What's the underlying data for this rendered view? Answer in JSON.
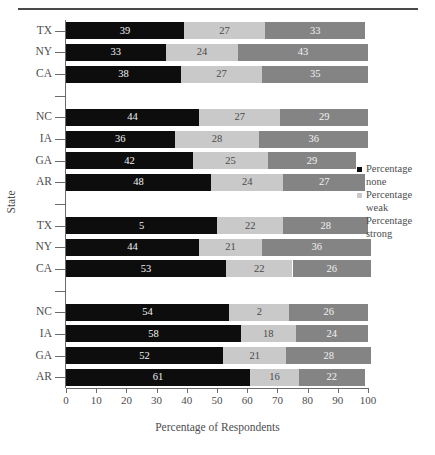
{
  "chart_data": {
    "type": "bar",
    "orientation": "horizontal",
    "stacked": true,
    "title": "",
    "xlabel": "Percentage of Respondents",
    "ylabel": "State",
    "xlim": [
      0,
      100
    ],
    "xticks": [
      0,
      10,
      20,
      30,
      40,
      50,
      60,
      70,
      80,
      90,
      100
    ],
    "grid": false,
    "legend_position": "right",
    "series": [
      {
        "name": "Percentage none",
        "key": "none",
        "color": "#0d0d0d"
      },
      {
        "name": "Percentage weak",
        "key": "weak",
        "color": "#c9c9c9"
      },
      {
        "name": "Percentage strong",
        "key": "strong",
        "color": "#848484"
      }
    ],
    "groups": [
      {
        "rows": [
          {
            "category": "TX",
            "none": 39,
            "weak": 27,
            "strong": 33
          },
          {
            "category": "NY",
            "none": 33,
            "weak": 24,
            "strong": 43
          },
          {
            "category": "CA",
            "none": 38,
            "weak": 27,
            "strong": 35
          }
        ]
      },
      {
        "rows": [
          {
            "category": "NC",
            "none": 44,
            "weak": 27,
            "strong": 29
          },
          {
            "category": "IA",
            "none": 36,
            "weak": 28,
            "strong": 36
          },
          {
            "category": "GA",
            "none": 42,
            "weak": 25,
            "strong": 29
          },
          {
            "category": "AR",
            "none": 48,
            "weak": 24,
            "strong": 27
          }
        ]
      },
      {
        "rows": [
          {
            "category": "TX",
            "none": 50,
            "weak": 22,
            "strong": 28,
            "none_label": "5"
          },
          {
            "category": "NY",
            "none": 44,
            "weak": 21,
            "strong": 36
          },
          {
            "category": "CA",
            "none": 53,
            "weak": 22,
            "strong": 26
          }
        ]
      },
      {
        "rows": [
          {
            "category": "NC",
            "none": 54,
            "weak": 20,
            "strong": 26,
            "weak_label": "2"
          },
          {
            "category": "IA",
            "none": 58,
            "weak": 18,
            "strong": 24
          },
          {
            "category": "GA",
            "none": 52,
            "weak": 21,
            "strong": 28
          },
          {
            "category": "AR",
            "none": 61,
            "weak": 16,
            "strong": 22
          }
        ]
      }
    ]
  },
  "legend": {
    "items": [
      {
        "label": "Percentage none"
      },
      {
        "label": "Percentage weak"
      },
      {
        "label": "Percentage strong"
      }
    ]
  },
  "axes": {
    "x_title": "Percentage of Respondents",
    "y_title": "State"
  }
}
